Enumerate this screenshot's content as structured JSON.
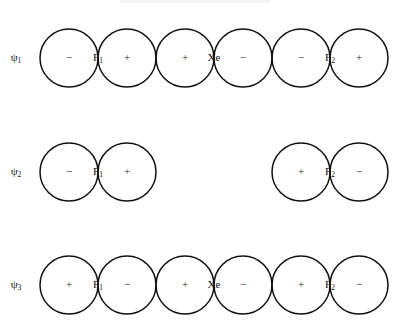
{
  "figure": {
    "caption_page_number": "",
    "molecule": "XeF2",
    "background_color": "#ffffff",
    "stroke_color": "#111111",
    "text_color": "#1a1a1a"
  },
  "rows": [
    {
      "id": "psi1",
      "psi_symbol": "ψ",
      "psi_subscript": "1",
      "center_y": 58,
      "has_center_orbital": true,
      "lobes": [
        {
          "sign": "−",
          "cx": 69
        },
        {
          "sign": "+",
          "cx": 127
        },
        {
          "sign": "+",
          "cx": 185
        },
        {
          "sign": "−",
          "cx": 243
        },
        {
          "sign": "−",
          "cx": 301
        },
        {
          "sign": "+",
          "cx": 359
        }
      ],
      "atoms": [
        {
          "element": "F",
          "subscript": "1",
          "cx": 98
        },
        {
          "element": "Xe",
          "subscript": "",
          "cx": 214
        },
        {
          "element": "F",
          "subscript": "2",
          "cx": 330
        }
      ]
    },
    {
      "id": "psi2",
      "psi_symbol": "ψ",
      "psi_subscript": "2",
      "center_y": 172,
      "has_center_orbital": false,
      "lobes": [
        {
          "sign": "−",
          "cx": 69
        },
        {
          "sign": "+",
          "cx": 127
        },
        {
          "sign": "+",
          "cx": 301
        },
        {
          "sign": "−",
          "cx": 359
        }
      ],
      "atoms": [
        {
          "element": "F",
          "subscript": "1",
          "cx": 98
        },
        {
          "element": "F",
          "subscript": "2",
          "cx": 330
        }
      ]
    },
    {
      "id": "psi3",
      "psi_symbol": "ψ",
      "psi_subscript": "3",
      "center_y": 285,
      "has_center_orbital": true,
      "lobes": [
        {
          "sign": "+",
          "cx": 69
        },
        {
          "sign": "−",
          "cx": 127
        },
        {
          "sign": "+",
          "cx": 185
        },
        {
          "sign": "−",
          "cx": 243
        },
        {
          "sign": "+",
          "cx": 301
        },
        {
          "sign": "−",
          "cx": 359
        }
      ],
      "atoms": [
        {
          "element": "F",
          "subscript": "1",
          "cx": 98
        },
        {
          "element": "Xe",
          "subscript": "",
          "cx": 214
        },
        {
          "element": "F",
          "subscript": "2",
          "cx": 330
        }
      ]
    }
  ],
  "geometry": {
    "circle_radius": 29,
    "psi_label_x": 16
  }
}
